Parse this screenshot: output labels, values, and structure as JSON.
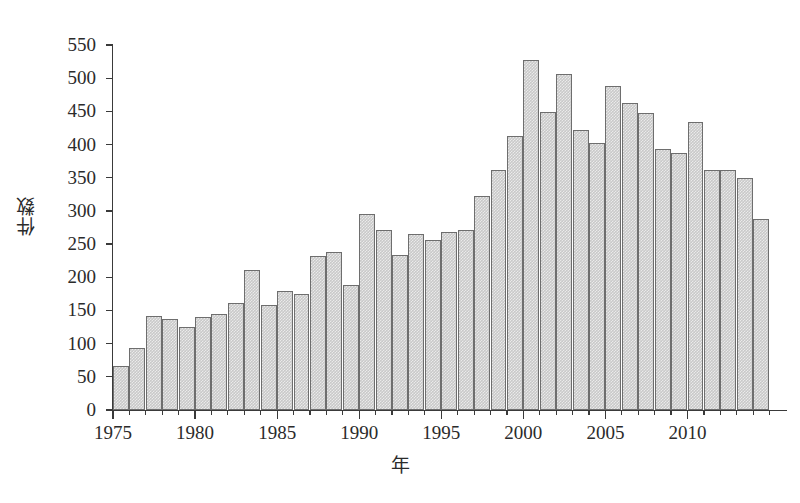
{
  "chart_data": {
    "type": "bar",
    "title": "",
    "subtitle": "",
    "xlabel": "年",
    "ylabel": "件数",
    "xlim": [
      1975,
      2015
    ],
    "ylim": [
      0,
      550
    ],
    "ytick_step": 50,
    "grid": false,
    "legend": null,
    "bar_color": "#c9c9c9",
    "bar_edge_color": "#6e6e6e",
    "axis_color": "#3a3a3a",
    "background_color": "#ffffff",
    "categories": [
      "1975",
      "1976",
      "1977",
      "1978",
      "1979",
      "1980",
      "1981",
      "1982",
      "1983",
      "1984",
      "1985",
      "1986",
      "1987",
      "1988",
      "1989",
      "1990",
      "1991",
      "1992",
      "1993",
      "1994",
      "1995",
      "1996",
      "1997",
      "1998",
      "1999",
      "2000",
      "2001",
      "2002",
      "2003",
      "2004",
      "2005",
      "2006",
      "2007",
      "2008",
      "2009",
      "2010",
      "2011",
      "2012",
      "2013",
      "2014"
    ],
    "values": [
      66,
      94,
      142,
      137,
      125,
      140,
      145,
      161,
      211,
      158,
      180,
      175,
      232,
      238,
      189,
      296,
      272,
      233,
      265,
      256,
      268,
      272,
      322,
      362,
      413,
      528,
      449,
      506,
      422,
      403,
      488,
      462,
      448,
      394,
      387,
      434,
      362,
      362,
      350,
      288
    ],
    "ytick_labels": [
      "0",
      "50",
      "100",
      "150",
      "200",
      "250",
      "300",
      "350",
      "400",
      "450",
      "500",
      "550"
    ],
    "ytick_values": [
      0,
      50,
      100,
      150,
      200,
      250,
      300,
      350,
      400,
      450,
      500,
      550
    ],
    "xtick_labels": [
      "1975",
      "1980",
      "1985",
      "1990",
      "1995",
      "2000",
      "2005",
      "2010"
    ],
    "xtick_values": [
      1975,
      1980,
      1985,
      1990,
      1995,
      2000,
      2005,
      2010
    ]
  }
}
